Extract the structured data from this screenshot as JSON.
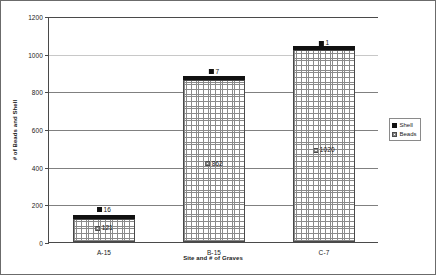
{
  "chart_data": {
    "type": "bar",
    "subtype": "stacked-column",
    "title": "",
    "xlabel": "Site and # of Graves",
    "ylabel": "# of Beads and Shell",
    "categories": [
      "A-15",
      "B-15",
      "C-7"
    ],
    "ylim": [
      0,
      1200
    ],
    "yticks": [
      0,
      200,
      400,
      600,
      800,
      1000,
      1200
    ],
    "ytick_labels": [
      "0",
      "200",
      "400",
      "600",
      "800",
      "1000",
      "1200"
    ],
    "grid": true,
    "legend_position": "right",
    "series": [
      {
        "name": "Beads",
        "values": [
          121,
          862,
          1020
        ],
        "value_labels": [
          "121",
          "862",
          "1020"
        ],
        "swatch": "hatched",
        "color": "#ffffff"
      },
      {
        "name": "Shell",
        "values": [
          16,
          7,
          1
        ],
        "value_labels": [
          "16",
          "7",
          "1"
        ],
        "swatch": "solid",
        "color": "#111111"
      }
    ]
  },
  "legend": {
    "items": [
      {
        "label": "Shell",
        "swatch": "solid"
      },
      {
        "label": "Beads",
        "swatch": "hatched"
      }
    ]
  }
}
